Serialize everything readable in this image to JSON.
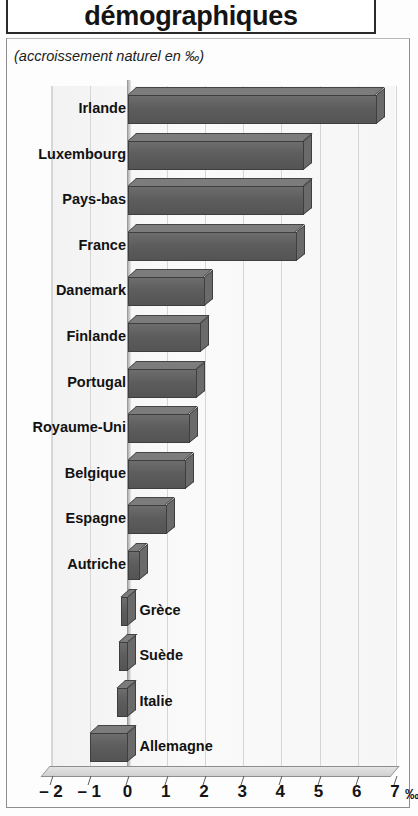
{
  "title": "démographiques",
  "subtitle": "(accroissement naturel en ‰)",
  "axis": {
    "unit": "‰",
    "ticks": [
      "– 2",
      "– 1",
      "0",
      "1",
      "2",
      "3",
      "4",
      "5",
      "6",
      "7"
    ]
  },
  "labels": {
    "irlande": "Irlande",
    "luxembourg": "Luxembourg",
    "pays_bas": "Pays-bas",
    "france": "France",
    "danemark": "Danemark",
    "finlande": "Finlande",
    "portugal": "Portugal",
    "royaume_uni": "Royaume-Uni",
    "belgique": "Belgique",
    "espagne": "Espagne",
    "autriche": "Autriche",
    "grece": "Grèce",
    "suede": "Suède",
    "italie": "Italie",
    "allemagne": "Allemagne"
  },
  "chart_data": {
    "type": "bar",
    "orientation": "horizontal",
    "title": "démographiques",
    "subtitle": "(accroissement naturel en ‰)",
    "xlabel": "‰",
    "ylabel": "",
    "xlim": [
      -2,
      7
    ],
    "xticks": [
      -2,
      -1,
      0,
      1,
      2,
      3,
      4,
      5,
      6,
      7
    ],
    "grid": true,
    "legend": false,
    "bar_color": "#5d5d5d",
    "categories": [
      "Irlande",
      "Luxembourg",
      "Pays-bas",
      "France",
      "Danemark",
      "Finlande",
      "Portugal",
      "Royaume-Uni",
      "Belgique",
      "Espagne",
      "Autriche",
      "Grèce",
      "Suède",
      "Italie",
      "Allemagne"
    ],
    "values": [
      6.5,
      4.6,
      4.6,
      4.4,
      2.0,
      1.9,
      1.8,
      1.6,
      1.5,
      1.0,
      0.3,
      -0.2,
      -0.25,
      -0.3,
      -1.0
    ]
  }
}
